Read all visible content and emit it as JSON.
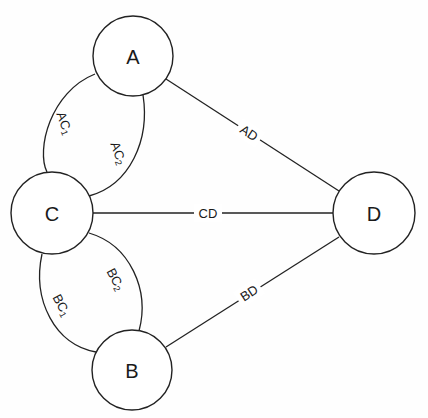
{
  "diagram": {
    "type": "graph",
    "nodes": [
      {
        "id": "A",
        "label": "A",
        "cx": 133,
        "cy": 56,
        "r": 40
      },
      {
        "id": "B",
        "label": "B",
        "cx": 132,
        "cy": 370,
        "r": 40
      },
      {
        "id": "C",
        "label": "C",
        "cx": 52,
        "cy": 213,
        "r": 41
      },
      {
        "id": "D",
        "label": "D",
        "cx": 374,
        "cy": 213,
        "r": 41
      }
    ],
    "edges": [
      {
        "id": "AC1",
        "from": "A",
        "to": "C",
        "label": "AC",
        "sub": "1",
        "style": "curved-left"
      },
      {
        "id": "AC2",
        "from": "A",
        "to": "C",
        "label": "AC",
        "sub": "2",
        "style": "curved-right"
      },
      {
        "id": "BC1",
        "from": "B",
        "to": "C",
        "label": "BC",
        "sub": "1",
        "style": "curved-left"
      },
      {
        "id": "BC2",
        "from": "B",
        "to": "C",
        "label": "BC",
        "sub": "2",
        "style": "curved-right"
      },
      {
        "id": "AD",
        "from": "A",
        "to": "D",
        "label": "AD",
        "style": "straight"
      },
      {
        "id": "CD",
        "from": "C",
        "to": "D",
        "label": "CD",
        "style": "straight"
      },
      {
        "id": "BD",
        "from": "B",
        "to": "D",
        "label": "BD",
        "style": "straight"
      }
    ]
  }
}
